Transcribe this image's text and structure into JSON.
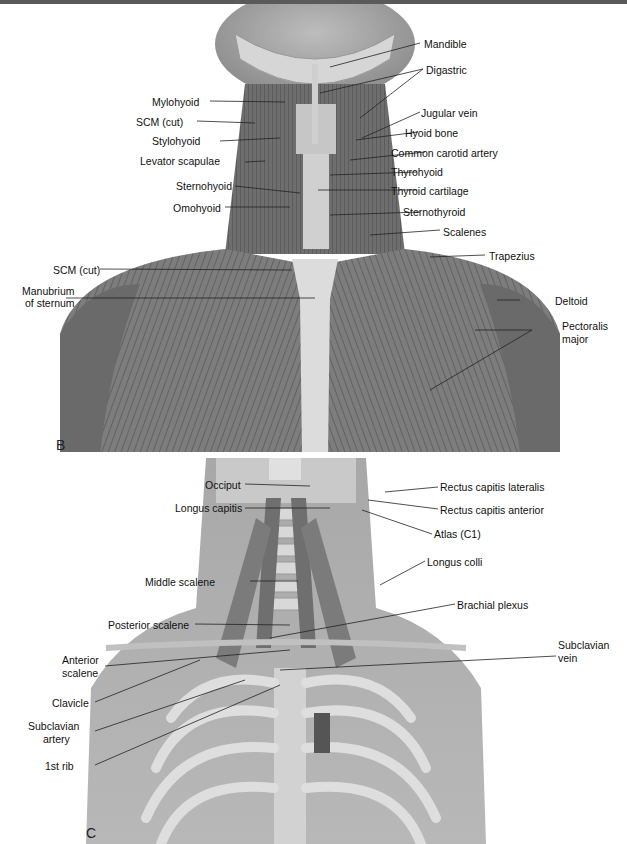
{
  "figure": {
    "panels": [
      {
        "id": "B",
        "letter": "B"
      },
      {
        "id": "C",
        "letter": "C"
      }
    ]
  },
  "panelB": {
    "letter": "B",
    "labels_left": [
      {
        "text": "Mylohyoid"
      },
      {
        "text": "SCM (cut)"
      },
      {
        "text": "Stylohyoid"
      },
      {
        "text": "Levator scapulae"
      },
      {
        "text": "Sternohyoid"
      },
      {
        "text": "Omohyoid"
      },
      {
        "text": "SCM (cut)"
      },
      {
        "text": "Manubrium"
      },
      {
        "text": "of sternum"
      }
    ],
    "labels_right": [
      {
        "text": "Mandible"
      },
      {
        "text": "Digastric"
      },
      {
        "text": "Jugular vein"
      },
      {
        "text": "Hyoid bone"
      },
      {
        "text": "Common carotid artery"
      },
      {
        "text": "Thyrohyoid"
      },
      {
        "text": "Thyroid cartilage"
      },
      {
        "text": "Sternothyroid"
      },
      {
        "text": "Scalenes"
      },
      {
        "text": "Trapezius"
      },
      {
        "text": "Deltoid"
      },
      {
        "text": "Pectoralis"
      },
      {
        "text": "major"
      }
    ]
  },
  "panelC": {
    "letter": "C",
    "labels_left": [
      {
        "text": "Occiput"
      },
      {
        "text": "Longus capitis"
      },
      {
        "text": "Middle scalene"
      },
      {
        "text": "Posterior scalene"
      },
      {
        "text": "Anterior"
      },
      {
        "text": "scalene"
      },
      {
        "text": "Clavicle"
      },
      {
        "text": "Subclavian"
      },
      {
        "text": "artery"
      },
      {
        "text": "1st rib"
      }
    ],
    "labels_right": [
      {
        "text": "Rectus capitis lateralis"
      },
      {
        "text": "Rectus capitis anterior"
      },
      {
        "text": "Atlas (C1)"
      },
      {
        "text": "Longus colli"
      },
      {
        "text": "Brachial plexus"
      },
      {
        "text": "Subclavian"
      },
      {
        "text": "vein"
      }
    ]
  }
}
